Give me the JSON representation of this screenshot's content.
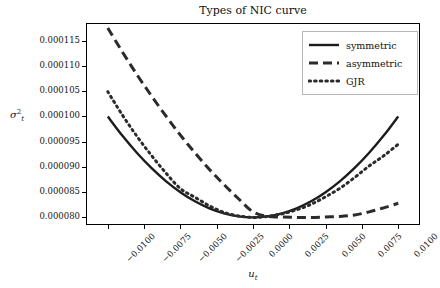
{
  "chart_data": {
    "type": "line",
    "title": "Types of NIC curve",
    "xlabel": "u_t",
    "ylabel": "sigma^2_t",
    "xlim": [
      -0.0115,
      0.0115
    ],
    "ylim": [
      7.85e-05,
      0.0001185
    ],
    "grid": false,
    "legend_position": "upper right",
    "xticks": [
      -0.01,
      -0.0075,
      -0.005,
      -0.0025,
      0.0,
      0.0025,
      0.005,
      0.0075,
      0.01
    ],
    "xtick_labels": [
      "−0.0100",
      "−0.0075",
      "−0.0050",
      "−0.0025",
      "0.0000",
      "0.0025",
      "0.0050",
      "0.0075",
      "0.0100"
    ],
    "yticks": [
      8e-05,
      8.5e-05,
      9e-05,
      9.5e-05,
      0.0001,
      0.000105,
      0.00011,
      0.000115
    ],
    "ytick_labels": [
      "0.000080",
      "0.000085",
      "0.000090",
      "0.000095",
      "0.000100",
      "0.000105",
      "0.000110",
      "0.000115"
    ],
    "x": [
      -0.01,
      -0.009,
      -0.008,
      -0.007,
      -0.006,
      -0.005,
      -0.004,
      -0.003,
      -0.002,
      -0.001,
      0.0,
      0.001,
      0.002,
      0.003,
      0.004,
      0.005,
      0.006,
      0.007,
      0.008,
      0.009,
      0.01
    ],
    "series": [
      {
        "name": "symmetric",
        "style": "solid",
        "color": "#1c1c1c",
        "values": [
          0.0001,
          9.62e-05,
          9.28e-05,
          8.98e-05,
          8.72e-05,
          8.5e-05,
          8.32e-05,
          8.18e-05,
          8.08e-05,
          8.02e-05,
          8e-05,
          8.02e-05,
          8.08e-05,
          8.18e-05,
          8.32e-05,
          8.5e-05,
          8.72e-05,
          8.98e-05,
          9.28e-05,
          9.62e-05,
          0.0001
        ]
      },
      {
        "name": "asymmetric",
        "style": "dashed",
        "color": "#2b2b2b",
        "values": [
          0.0001175,
          0.0001128,
          0.0001083,
          0.0001041,
          0.0001001,
          9.63e-05,
          9.28e-05,
          8.95e-05,
          8.65e-05,
          8.37e-05,
          8.11e-05,
          8.02e-05,
          8.01e-05,
          8e-05,
          8e-05,
          8.01e-05,
          8.02e-05,
          8.05e-05,
          8.11e-05,
          8.19e-05,
          8.28e-05
        ]
      },
      {
        "name": "GJR",
        "style": "dotted",
        "color": "#2b2b2b",
        "values": [
          0.0001049,
          0.0001003,
          9.61e-05,
          9.23e-05,
          8.88e-05,
          8.57e-05,
          8.4e-05,
          8.23e-05,
          8.1e-05,
          8.03e-05,
          8e-05,
          8.02e-05,
          8.07e-05,
          8.15e-05,
          8.26e-05,
          8.41e-05,
          8.58e-05,
          8.79e-05,
          9.02e-05,
          9.22e-05,
          9.45e-05
        ]
      }
    ]
  },
  "legend": {
    "items": [
      {
        "label": "symmetric"
      },
      {
        "label": "asymmetric"
      },
      {
        "label": "GJR"
      }
    ]
  },
  "axis_text": {
    "y_label_base": "σ",
    "y_label_sup": "2",
    "y_label_sub": "t",
    "x_label_base": "u",
    "x_label_sub": "t"
  }
}
